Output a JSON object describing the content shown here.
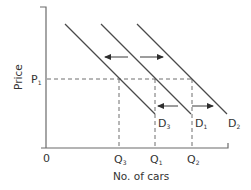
{
  "diagram": {
    "y_axis_label": "Price",
    "x_axis_label": "No. of cars",
    "origin_label": "0",
    "price_level": {
      "label": "P",
      "sub": "1"
    },
    "curves": [
      {
        "id": "D3",
        "label": "D",
        "sub": "3"
      },
      {
        "id": "D1",
        "label": "D",
        "sub": "1"
      },
      {
        "id": "D2",
        "label": "D",
        "sub": "2"
      }
    ],
    "quantities": [
      {
        "id": "Q3",
        "label": "Q",
        "sub": "3"
      },
      {
        "id": "Q1",
        "label": "Q",
        "sub": "1"
      },
      {
        "id": "Q2",
        "label": "Q",
        "sub": "2"
      }
    ],
    "shifts": [
      {
        "from": "D1",
        "to": "D3",
        "direction": "left"
      },
      {
        "from": "D1",
        "to": "D2",
        "direction": "right"
      }
    ]
  }
}
